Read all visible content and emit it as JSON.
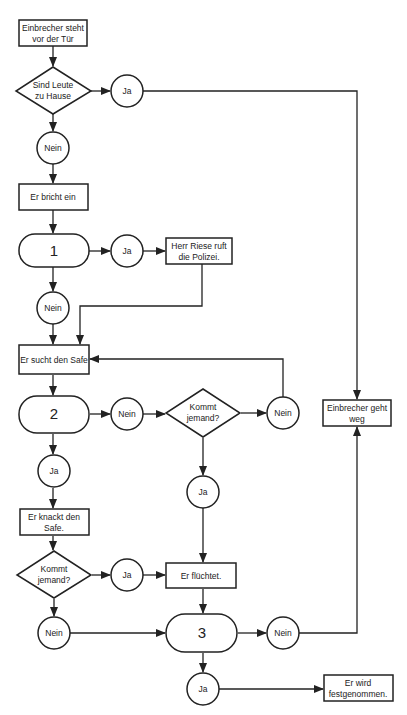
{
  "diagram": {
    "type": "flowchart",
    "nodes": {
      "start": {
        "line1": "Einbrecher steht",
        "line2": "vor der Tür"
      },
      "d_home": {
        "line1": "Sind Leute",
        "line2": "zu Hause"
      },
      "c_home_ja": {
        "label": "Ja"
      },
      "c_home_nein": {
        "label": "Nein"
      },
      "breaks_in": {
        "label": "Er bricht ein"
      },
      "s1": {
        "label": "1"
      },
      "c1_ja": {
        "label": "Ja"
      },
      "police": {
        "line1": "Herr Riese ruft",
        "line2": "die Polizei."
      },
      "c1_nein": {
        "label": "Nein"
      },
      "search_safe": {
        "label": "Er sucht den Safe"
      },
      "s2": {
        "label": "2"
      },
      "c2_nein": {
        "label": "Nein"
      },
      "d_comes_a": {
        "line1": "Kommt",
        "line2": "jemand?"
      },
      "c_comes_a_nein": {
        "label": "Nein"
      },
      "c_comes_a_ja": {
        "label": "Ja"
      },
      "leaves": {
        "line1": "Einbrecher geht",
        "line2": "weg"
      },
      "c2_ja": {
        "label": "Ja"
      },
      "cracks_safe": {
        "line1": "Er knackt den",
        "line2": "Safe."
      },
      "d_comes_b": {
        "line1": "Kommt",
        "line2": "jemand?"
      },
      "c_comes_b_ja": {
        "label": "Ja"
      },
      "flees": {
        "label": "Er flüchtet."
      },
      "c_comes_b_nein": {
        "label": "Nein"
      },
      "s3": {
        "label": "3"
      },
      "c3_nein": {
        "label": "Nein"
      },
      "c3_ja": {
        "label": "Ja"
      },
      "arrested": {
        "line1": "Er wird",
        "line2": "festgenommen."
      }
    }
  }
}
